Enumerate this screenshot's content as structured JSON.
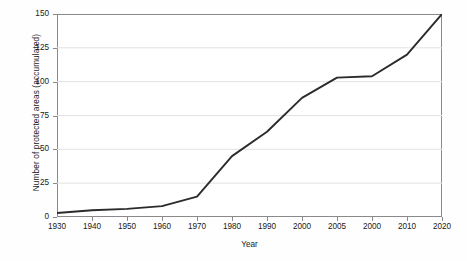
{
  "chart_data": {
    "type": "line",
    "title": "",
    "xlabel": "Year",
    "ylabel": "Number of protected areas (accumulated)",
    "x_tick_labels": [
      "1930",
      "1940",
      "1950",
      "1960",
      "1970",
      "1980",
      "1990",
      "2000",
      "2005",
      "2000",
      "2010",
      "2020"
    ],
    "y_tick_labels": [
      "0",
      "25",
      "50",
      "75",
      "100",
      "125",
      "150"
    ],
    "categories": [
      "1930",
      "1940",
      "1950",
      "1960",
      "1970",
      "1980",
      "1990",
      "2000",
      "2005",
      "2000",
      "2010",
      "2020"
    ],
    "values": [
      3,
      5,
      6,
      8,
      15,
      45,
      63,
      88,
      103,
      104,
      120,
      150
    ],
    "ylim": [
      0,
      150
    ],
    "ytick_step": 25,
    "grid": "horizontal",
    "legend": "none",
    "line_color": "#2b2b2b",
    "grid_color": "#e2e2e2",
    "axis_color": "#8a8a8a",
    "background_color": "#ffffff"
  },
  "axes": {
    "x_title": "Year",
    "y_title": "Number of protected areas (accumulated)"
  }
}
